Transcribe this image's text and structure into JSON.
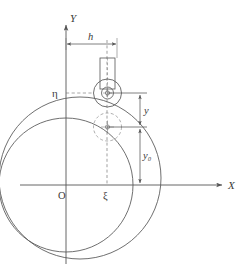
{
  "figure": {
    "kind": "engineering-kinematics-diagram",
    "background_color": "#ffffff",
    "line_color": "#555555",
    "label_color": "#3a3a3a"
  },
  "axes": {
    "origin_label": "O",
    "x_axis_label": "X",
    "y_axis_label": "Y",
    "origin_px": {
      "x": 66,
      "y": 185
    },
    "x_axis": {
      "x1": 20,
      "y1": 185,
      "x2": 226,
      "y2": 185
    },
    "y_axis": {
      "x1": 66,
      "y1": 264,
      "x2": 66,
      "y2": 22
    }
  },
  "labels": {
    "h": "h",
    "y": "y",
    "y0": "y₀",
    "xi": "ξ",
    "eta": "η",
    "origin": "O",
    "x": "X",
    "y_axis": "Y"
  },
  "dimensions": {
    "h": {
      "label": "h",
      "y_px": 44,
      "x_from": 66,
      "x_to": 117,
      "meaning": "horizontal offset of follower axis from Y axis"
    },
    "y": {
      "label": "y",
      "x_px": 140,
      "y_from": 93,
      "y_to": 127,
      "meaning": "follower displacement"
    },
    "y0": {
      "label": "y₀",
      "x_px": 140,
      "y_from": 127,
      "y_to": 185,
      "meaning": "initial follower height"
    }
  },
  "circles": {
    "base_circle": {
      "name": "base-circle",
      "cx": 66,
      "cy": 185,
      "r": 67,
      "style": "solid"
    },
    "displaced_circle": {
      "name": "displaced-circle",
      "cx": 80,
      "cy": 178,
      "r": 81,
      "style": "solid"
    },
    "roller_outer": {
      "name": "roller-outer-circle",
      "cx": 107,
      "cy": 93,
      "r": 14,
      "style": "solid"
    },
    "roller_inner": {
      "name": "roller-inner-circle",
      "cx": 107,
      "cy": 93,
      "r": 6,
      "style": "solid"
    },
    "roller_hub": {
      "name": "roller-hub",
      "cx": 107,
      "cy": 93,
      "r": 2.2,
      "style": "solid"
    },
    "phantom_roller": {
      "name": "phantom-roller-circle",
      "cx": 107,
      "cy": 127,
      "r": 14,
      "style": "dashed"
    },
    "phantom_hub": {
      "name": "phantom-roller-hub",
      "cx": 107,
      "cy": 127,
      "r": 2.2,
      "style": "solid"
    }
  },
  "guide_bar": {
    "name": "follower-guide-bar",
    "x": 100,
    "y": 58,
    "width": 15,
    "height": 30,
    "centerline_style": "dashed"
  },
  "construction_lines": {
    "eta_line": {
      "x1": 66,
      "y1": 93,
      "x2": 104,
      "y2": 93,
      "style": "dashed"
    },
    "eta_line_right": {
      "x1": 107,
      "y1": 93,
      "x2": 146,
      "y2": 93,
      "style": "solid"
    },
    "xi_line": {
      "x1": 107,
      "y1": 44,
      "x2": 107,
      "y2": 185,
      "style": "dashed"
    },
    "center_line": {
      "x1": 107,
      "y1": 127,
      "x2": 146,
      "y2": 127,
      "style": "solid"
    }
  }
}
